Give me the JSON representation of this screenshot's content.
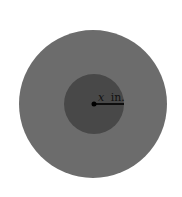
{
  "diagram": {
    "outer_circle": {
      "cx": 93,
      "cy": 104,
      "r": 74,
      "color": "#6c6c6c"
    },
    "inner_circle": {
      "cx": 94,
      "cy": 104,
      "r": 30,
      "color": "#484848"
    },
    "center_dot": {
      "cx": 94,
      "cy": 104,
      "r": 2.5,
      "color": "#000000"
    },
    "radius_line": {
      "x1": 94,
      "y1": 104,
      "x2": 124,
      "y2": 104,
      "color": "#000000"
    },
    "radius_label": {
      "variable": "x",
      "unit": "in."
    }
  }
}
